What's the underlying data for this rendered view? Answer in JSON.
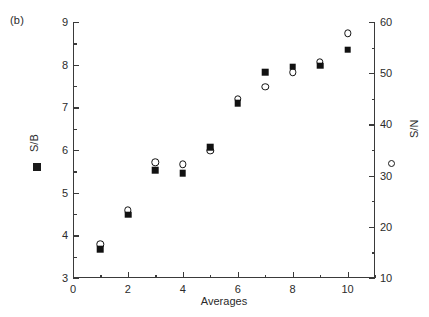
{
  "figure": {
    "panel_label": "(b)"
  },
  "chart_data": {
    "type": "scatter",
    "title": "",
    "xlabel": "Averages",
    "ylabel": "S/B",
    "y2label": "S/N",
    "xlim": [
      0,
      11
    ],
    "ylim": [
      3,
      9
    ],
    "y2lim": [
      10,
      60
    ],
    "grid": false,
    "legend_position": "axis-labels",
    "x_ticks": [
      0,
      2,
      4,
      6,
      8,
      10
    ],
    "x_ticklabels": [
      "0",
      "2",
      "4",
      "6",
      "8",
      "10"
    ],
    "x_minor_ticks": [
      1,
      3,
      5,
      7,
      9,
      11
    ],
    "y_ticks": [
      3,
      4,
      5,
      6,
      7,
      8,
      9
    ],
    "y_ticklabels": [
      "3",
      "4",
      "5",
      "6",
      "7",
      "8",
      "9"
    ],
    "y_minor_ticks": [
      3.5,
      4.5,
      5.5,
      6.5,
      7.5,
      8.5
    ],
    "y2_ticks": [
      10,
      20,
      30,
      40,
      50,
      60
    ],
    "y2_ticklabels": [
      "10",
      "20",
      "30",
      "40",
      "50",
      "60"
    ],
    "y2_minor_ticks": [
      15,
      25,
      35,
      45,
      55
    ],
    "x": [
      1,
      2,
      3,
      4,
      5,
      6,
      7,
      8,
      9,
      10
    ],
    "series": [
      {
        "name": "S/B",
        "marker": "filled-square",
        "axis": "left",
        "values": [
          3.68,
          4.48,
          5.52,
          5.45,
          6.07,
          7.1,
          7.82,
          7.95,
          7.98,
          8.35
        ]
      },
      {
        "name": "S/N",
        "marker": "open-circle",
        "axis": "right",
        "values": [
          16.6,
          23.2,
          32.6,
          32.2,
          34.8,
          45.0,
          47.4,
          50.2,
          52.2,
          57.8
        ]
      }
    ],
    "colors": {
      "marker": "#111111",
      "axis": "#3a3a3a",
      "text": "#2b2b2b",
      "background": "#ffffff"
    }
  }
}
